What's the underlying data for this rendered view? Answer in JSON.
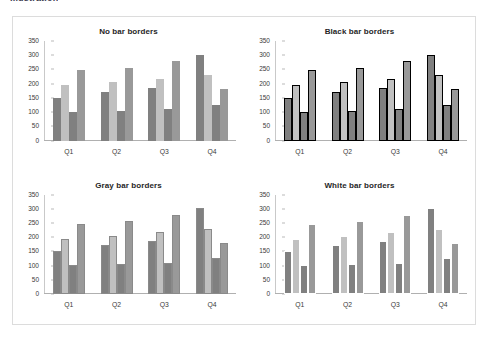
{
  "document": {
    "header_text": "Illustration"
  },
  "figure": {
    "panels": [
      {
        "title": "No bar borders",
        "border_style": "none",
        "border_color": "none"
      },
      {
        "title": "Black bar borders",
        "border_style": "black",
        "border_color": "#000000"
      },
      {
        "title": "Gray bar borders",
        "border_style": "gray",
        "border_color": "#8a8a8a"
      },
      {
        "title": "White bar borders",
        "border_style": "white",
        "border_color": "#ffffff"
      }
    ]
  },
  "chart_data": {
    "type": "bar",
    "categories": [
      "Q1",
      "Q2",
      "Q3",
      "Q4"
    ],
    "xlabel": "",
    "ylabel": "",
    "ylim": [
      0,
      350
    ],
    "yticks": [
      0,
      50,
      100,
      150,
      200,
      250,
      300,
      350
    ],
    "grid": false,
    "legend": "none",
    "series": [
      {
        "name": "Series 1",
        "color": "#808080",
        "values": [
          150,
          172,
          185,
          302
        ]
      },
      {
        "name": "Series 2",
        "color": "#c0c0c0",
        "values": [
          194,
          205,
          218,
          229
        ]
      },
      {
        "name": "Series 3",
        "color": "#808080",
        "values": [
          101,
          104,
          110,
          125
        ]
      },
      {
        "name": "Series 4",
        "color": "#999999",
        "values": [
          248,
          256,
          279,
          180
        ]
      }
    ]
  }
}
